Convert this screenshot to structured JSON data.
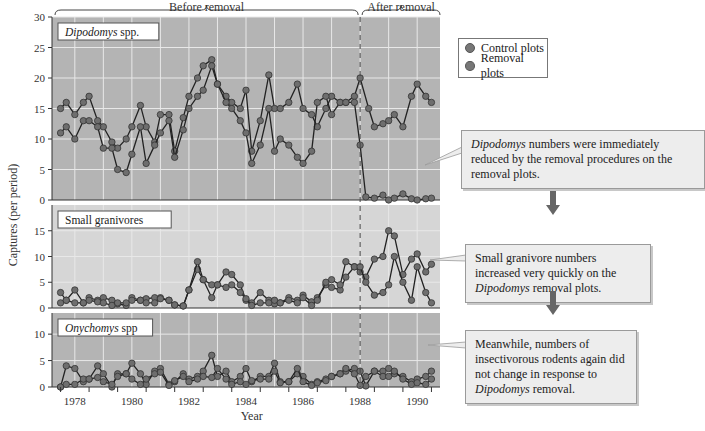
{
  "title_labels": {
    "before": "Before removal",
    "after": "After removal"
  },
  "axis": {
    "ylabel": "Captures (per period)",
    "xlabel": "Year"
  },
  "legend": [
    {
      "label": "Control plots",
      "color": "#6f6f6f"
    },
    {
      "label": "Removal plots",
      "color": "#6f6f6f"
    }
  ],
  "callouts": [
    {
      "italic": "Dipodomys",
      "text": " numbers were immediately reduced by the removal procedures on the removal plots."
    },
    {
      "pre": "Small granivore numbers increased very quickly on the ",
      "italic": "Dipodomys",
      "post": " removal plots."
    },
    {
      "pre": "Meanwhile, numbers of insectivorous rodents again did not change in response to ",
      "italic": "Dipodomys",
      "post": " removal."
    }
  ],
  "colors": {
    "panel_dark": "#b4b4b4",
    "panel_light": "#d6d6d6",
    "grid": "#e8e8e8",
    "line": "#222222",
    "marker": "#6e6e6e",
    "arrow": "#666666"
  },
  "chart_data": {
    "type": "line",
    "title": "",
    "xlabel": "Year",
    "ylabel": "Captures (per period)",
    "x_ticks": [
      1978,
      1980,
      1982,
      1984,
      1986,
      1988,
      1990
    ],
    "xlim": [
      1977.2,
      1990.8
    ],
    "removal_year": 1988,
    "annotations": [
      "Before removal",
      "After removal"
    ],
    "panels": [
      {
        "name": "Dipodomys spp.",
        "italic": true,
        "ylim": [
          0,
          30
        ],
        "yticks": [
          0,
          5,
          10,
          15,
          20,
          25,
          30
        ],
        "series": [
          {
            "name": "Control plots",
            "x": [
              1977.5,
              1977.7,
              1978.0,
              1978.3,
              1978.5,
              1978.8,
              1979.0,
              1979.3,
              1979.5,
              1979.8,
              1980.0,
              1980.3,
              1980.5,
              1980.8,
              1981.0,
              1981.3,
              1981.5,
              1981.8,
              1982.0,
              1982.3,
              1982.5,
              1982.8,
              1983.0,
              1983.3,
              1983.5,
              1983.8,
              1984.0,
              1984.2,
              1984.5,
              1984.8,
              1985.0,
              1985.2,
              1985.5,
              1985.8,
              1986.0,
              1986.3,
              1986.5,
              1986.8,
              1987.0,
              1987.3,
              1987.5,
              1987.8,
              1988.0,
              1988.3,
              1988.5,
              1988.8,
              1989.0,
              1989.2,
              1989.5,
              1989.8,
              1990.0,
              1990.3,
              1990.5
            ],
            "values": [
              15,
              16,
              14,
              16,
              17,
              13,
              12,
              9.5,
              8.5,
              10,
              12,
              15.5,
              12,
              9.5,
              14,
              14,
              8,
              13.5,
              17,
              20,
              22,
              23,
              19,
              17,
              16,
              15,
              18,
              8,
              13,
              20.5,
              15,
              15,
              16,
              19,
              15,
              14,
              12,
              15,
              17,
              16,
              16,
              17,
              20,
              15,
              12,
              12.5,
              13,
              14,
              12,
              17,
              19,
              17,
              16
            ]
          },
          {
            "name": "Removal plots",
            "x": [
              1977.5,
              1977.7,
              1978.0,
              1978.3,
              1978.5,
              1978.8,
              1979.0,
              1979.3,
              1979.5,
              1979.8,
              1980.0,
              1980.3,
              1980.5,
              1980.8,
              1981.0,
              1981.3,
              1981.5,
              1981.8,
              1982.0,
              1982.3,
              1982.5,
              1982.8,
              1983.0,
              1983.3,
              1983.5,
              1983.8,
              1984.0,
              1984.2,
              1984.5,
              1984.8,
              1985.0,
              1985.2,
              1985.5,
              1985.8,
              1986.0,
              1986.3,
              1986.5,
              1986.8,
              1987.0,
              1987.3,
              1987.5,
              1987.8,
              1988.0,
              1988.2,
              1988.5,
              1988.8,
              1989.0,
              1989.2,
              1989.5,
              1989.8,
              1990.0,
              1990.3,
              1990.5
            ],
            "values": [
              11,
              12,
              10,
              13,
              13,
              12,
              8.5,
              8.5,
              5,
              4.5,
              7.5,
              12,
              6,
              9,
              11,
              13,
              7,
              11.5,
              15,
              17,
              18,
              22,
              19,
              16,
              15,
              13,
              11,
              6,
              9,
              15,
              8,
              10,
              9,
              7,
              6,
              8,
              16,
              17,
              14,
              16,
              16,
              16,
              9,
              0.5,
              0.3,
              0.8,
              0,
              0.3,
              1,
              0.2,
              0,
              0.2,
              0.3
            ]
          }
        ]
      },
      {
        "name": "Small granivores",
        "italic": false,
        "ylim": [
          0,
          20
        ],
        "yticks": [
          0,
          5,
          10,
          15
        ],
        "series": [
          {
            "name": "Control plots",
            "x": [
              1977.5,
              1977.7,
              1978.0,
              1978.3,
              1978.5,
              1978.8,
              1979.0,
              1979.3,
              1979.5,
              1979.8,
              1980.0,
              1980.3,
              1980.5,
              1980.8,
              1981.0,
              1981.3,
              1981.5,
              1981.8,
              1982.0,
              1982.3,
              1982.5,
              1982.8,
              1983.0,
              1983.3,
              1983.5,
              1983.8,
              1984.0,
              1984.2,
              1984.5,
              1984.8,
              1985.0,
              1985.2,
              1985.5,
              1985.8,
              1986.0,
              1986.3,
              1986.5,
              1986.8,
              1987.0,
              1987.3,
              1987.5,
              1987.8,
              1988.0,
              1988.2,
              1988.5,
              1988.8,
              1989.0,
              1989.2,
              1989.5,
              1989.8,
              1990.0,
              1990.3,
              1990.5
            ],
            "values": [
              3,
              1.5,
              3.5,
              1,
              2,
              1.5,
              2,
              1.5,
              0.8,
              0.5,
              2,
              1.5,
              1.8,
              2,
              2,
              1.5,
              0.6,
              0.4,
              3.5,
              7.5,
              5.5,
              2,
              4.5,
              7,
              6.5,
              4.5,
              1.5,
              1,
              3,
              1.5,
              0.8,
              1,
              2,
              1.5,
              2.5,
              1.2,
              2,
              4.5,
              4,
              3.5,
              6,
              8,
              7,
              6,
              9.5,
              10,
              15,
              14,
              6.5,
              9.5,
              10.5,
              7,
              8.5
            ]
          },
          {
            "name": "Removal plots",
            "x": [
              1977.5,
              1977.7,
              1978.0,
              1978.3,
              1978.5,
              1978.8,
              1979.0,
              1979.3,
              1979.5,
              1979.8,
              1980.0,
              1980.3,
              1980.5,
              1980.8,
              1981.0,
              1981.3,
              1981.5,
              1981.8,
              1982.0,
              1982.3,
              1982.5,
              1982.8,
              1983.0,
              1983.3,
              1983.5,
              1983.8,
              1984.0,
              1984.2,
              1984.5,
              1984.8,
              1985.0,
              1985.2,
              1985.5,
              1985.8,
              1986.0,
              1986.3,
              1986.5,
              1986.8,
              1987.0,
              1987.3,
              1987.5,
              1987.8,
              1988.0,
              1988.2,
              1988.5,
              1988.8,
              1989.0,
              1989.2,
              1989.5,
              1989.8,
              1990.0,
              1990.3,
              1990.5
            ],
            "values": [
              1,
              1.5,
              1,
              1,
              1.5,
              1.2,
              1,
              0.5,
              1,
              1,
              1.5,
              1.5,
              1,
              1,
              1.8,
              1.5,
              0.6,
              0.4,
              3.5,
              9,
              5.5,
              4.5,
              4.5,
              4,
              4.5,
              3,
              1.8,
              0.5,
              1,
              1,
              1.5,
              1,
              1.5,
              1,
              2,
              0.5,
              1.5,
              5,
              5.5,
              4.5,
              9,
              8,
              8,
              5,
              2.5,
              3,
              4.5,
              10,
              5,
              1.5,
              8,
              3,
              1
            ]
          }
        ]
      },
      {
        "name": "Onychomys spp",
        "italic": true,
        "ylim": [
          0,
          14
        ],
        "yticks": [
          0,
          5,
          10
        ],
        "series": [
          {
            "name": "Control plots",
            "x": [
              1977.5,
              1977.7,
              1978.0,
              1978.3,
              1978.5,
              1978.8,
              1979.0,
              1979.3,
              1979.5,
              1979.8,
              1980.0,
              1980.3,
              1980.5,
              1980.8,
              1981.0,
              1981.3,
              1981.5,
              1981.8,
              1982.0,
              1982.3,
              1982.5,
              1982.8,
              1983.0,
              1983.3,
              1983.5,
              1983.8,
              1984.0,
              1984.2,
              1984.5,
              1984.8,
              1985.0,
              1985.2,
              1985.5,
              1985.8,
              1986.0,
              1986.3,
              1986.5,
              1986.8,
              1987.0,
              1987.3,
              1987.5,
              1987.8,
              1988.0,
              1988.2,
              1988.5,
              1988.8,
              1989.0,
              1989.2,
              1989.5,
              1989.8,
              1990.0,
              1990.3,
              1990.5
            ],
            "values": [
              0,
              4,
              3.5,
              1,
              1.5,
              4,
              2.5,
              0,
              2.5,
              2.5,
              4.5,
              2.5,
              0.5,
              3,
              3.5,
              0.5,
              1,
              2.5,
              1.5,
              2,
              3,
              6,
              2,
              3,
              1,
              2,
              3.5,
              1,
              2,
              2,
              4.5,
              1,
              1,
              2.5,
              2,
              0.5,
              1,
              1.5,
              2,
              2.5,
              3,
              3.5,
              3,
              0.2,
              3,
              3,
              3.5,
              2.5,
              2,
              1,
              1.5,
              2,
              3
            ]
          },
          {
            "name": "Removal plots",
            "x": [
              1977.5,
              1977.7,
              1978.0,
              1978.3,
              1978.5,
              1978.8,
              1979.0,
              1979.3,
              1979.5,
              1979.8,
              1980.0,
              1980.3,
              1980.5,
              1980.8,
              1981.0,
              1981.3,
              1981.5,
              1981.8,
              1982.0,
              1982.3,
              1982.5,
              1982.8,
              1983.0,
              1983.3,
              1983.5,
              1983.8,
              1984.0,
              1984.2,
              1984.5,
              1984.8,
              1985.0,
              1985.2,
              1985.5,
              1985.8,
              1986.0,
              1986.3,
              1986.5,
              1986.8,
              1987.0,
              1987.3,
              1987.5,
              1987.8,
              1988.0,
              1988.2,
              1988.5,
              1988.8,
              1989.0,
              1989.2,
              1989.5,
              1989.8,
              1990.0,
              1990.3,
              1990.5
            ],
            "values": [
              0,
              0.5,
              0.5,
              1.5,
              1.5,
              1.8,
              1,
              0.5,
              2,
              2.5,
              1.5,
              0.5,
              1.5,
              2.5,
              2.8,
              0.3,
              1.2,
              2,
              1,
              1.5,
              2,
              1.8,
              3.5,
              1.5,
              0.5,
              1,
              0.5,
              1.2,
              1.5,
              1.5,
              3,
              0.8,
              1,
              3.5,
              1,
              0.3,
              0.8,
              1.2,
              2,
              2.5,
              3.5,
              2.5,
              0.3,
              2,
              3,
              2,
              2,
              3,
              1.5,
              0.5,
              0.8,
              0.5,
              1.5
            ]
          }
        ]
      }
    ],
    "legend_position": "right"
  }
}
